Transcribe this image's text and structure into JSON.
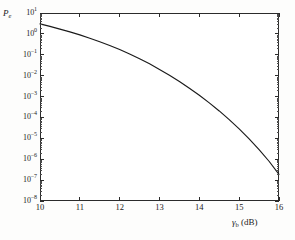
{
  "figure": {
    "background_color": "#fdfdfc",
    "plot_background_color": "#ffffff",
    "axis_color": "#2b2b2b",
    "curve_color": "#1a1a1a"
  },
  "axis_titles": {
    "y_main": "P",
    "y_sub": "e",
    "x_symbol": "γ",
    "x_sub": "b",
    "x_unit": "(dB)"
  },
  "chart_data": {
    "type": "line",
    "title": "",
    "subtitle": "",
    "xlabel": "γb (dB)",
    "ylabel": "Pe",
    "xscale": "linear",
    "yscale": "log",
    "xlim": [
      10,
      16
    ],
    "ylim": [
      1e-08,
      10
    ],
    "grid": false,
    "legend": null,
    "xticks": [
      10,
      11,
      12,
      13,
      14,
      15,
      16
    ],
    "xticklabels": [
      "10",
      "11",
      "12",
      "13",
      "14",
      "15",
      "16"
    ],
    "yticks": [
      10,
      1,
      0.1,
      0.01,
      0.001,
      0.0001,
      1e-05,
      1e-06,
      1e-07,
      1e-08
    ],
    "yticklabels": [
      "10¹",
      "10⁰",
      "10⁻¹",
      "10⁻²",
      "10⁻³",
      "10⁻⁴",
      "10⁻⁵",
      "10⁻⁶",
      "10⁻⁷",
      "10⁻⁸"
    ],
    "yticklabels_parts": [
      {
        "base": "10",
        "exp": "1"
      },
      {
        "base": "10",
        "exp": "0"
      },
      {
        "base": "10",
        "exp": "-1"
      },
      {
        "base": "10",
        "exp": "-2"
      },
      {
        "base": "10",
        "exp": "-3"
      },
      {
        "base": "10",
        "exp": "-4"
      },
      {
        "base": "10",
        "exp": "-5"
      },
      {
        "base": "10",
        "exp": "-6"
      },
      {
        "base": "10",
        "exp": "-7"
      },
      {
        "base": "10",
        "exp": "-8"
      }
    ],
    "series": [
      {
        "name": "Pe",
        "x": [
          10.0,
          10.25,
          10.5,
          10.75,
          11.0,
          11.25,
          11.5,
          11.75,
          12.0,
          12.25,
          12.5,
          12.75,
          13.0,
          13.25,
          13.5,
          13.75,
          14.0,
          14.25,
          14.5,
          14.75,
          15.0,
          15.25,
          15.5,
          15.75,
          16.0
        ],
        "y": [
          3.0,
          2.3,
          1.7,
          1.25,
          0.9,
          0.62,
          0.42,
          0.28,
          0.18,
          0.11,
          0.065,
          0.037,
          0.02,
          0.0105,
          0.0053,
          0.0025,
          0.00115,
          0.0005,
          0.000205,
          7.9e-05,
          2.85e-05,
          9.5e-06,
          2.9e-06,
          8e-07,
          1.9e-07
        ]
      }
    ]
  }
}
